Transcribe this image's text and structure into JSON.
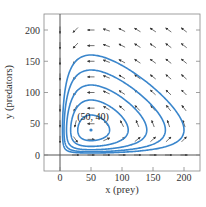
{
  "chart_data": {
    "type": "line",
    "subtype": "phase-portrait",
    "title": "",
    "xlabel": "x (prey)",
    "ylabel": "y (predators)",
    "xlim": [
      -25,
      225
    ],
    "ylim": [
      -25,
      225
    ],
    "xticks": [
      0,
      50,
      100,
      150,
      200
    ],
    "yticks": [
      0,
      50,
      100,
      150,
      200
    ],
    "grid": false,
    "legend": null,
    "equilibrium": {
      "x": 50,
      "y": 40,
      "label": "(50, 40)"
    },
    "orbit_color": "#3a86cc",
    "arrow_color": "#333333",
    "frame_color": "#888888",
    "zero_axis_color": "#555555",
    "orbits": [
      {
        "name": "orbit-1",
        "x_min": 30,
        "x_max": 80,
        "y_min": 18,
        "y_max": 75
      },
      {
        "name": "orbit-2",
        "x_min": 17,
        "x_max": 110,
        "y_min": 8,
        "y_max": 115
      },
      {
        "name": "orbit-3",
        "x_min": 10,
        "x_max": 140,
        "y_min": 4,
        "y_max": 155
      },
      {
        "name": "orbit-4",
        "x_min": 6,
        "x_max": 170,
        "y_min": 2,
        "y_max": 195
      },
      {
        "name": "orbit-5",
        "x_min": 3,
        "x_max": 200,
        "y_min": 1,
        "y_max": 240
      }
    ],
    "field_grid": {
      "x": [
        0,
        25,
        50,
        75,
        100,
        125,
        150,
        175,
        200
      ],
      "y": [
        0,
        25,
        50,
        75,
        100,
        125,
        150,
        175,
        200
      ]
    }
  }
}
